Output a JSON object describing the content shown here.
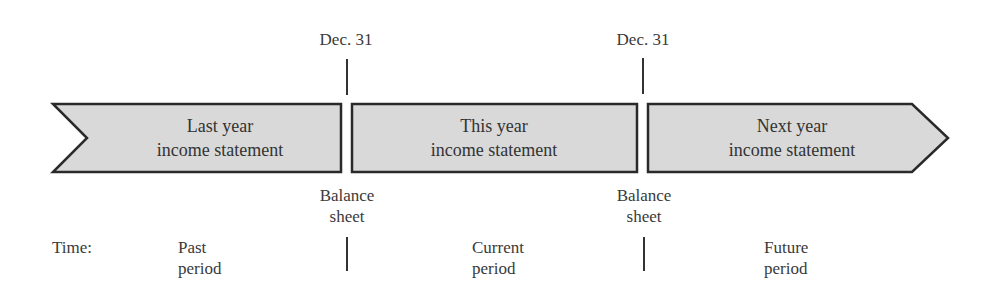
{
  "diagram": {
    "top_labels": [
      {
        "id": "dec31-left",
        "text": "Dec. 31"
      },
      {
        "id": "dec31-right",
        "text": "Dec. 31"
      }
    ],
    "periods": [
      {
        "line1": "Last year",
        "line2": "income statement"
      },
      {
        "line1": "This year",
        "line2": "income statement"
      },
      {
        "line1": "Next year",
        "line2": "income statement"
      }
    ],
    "balance_sheets": [
      {
        "line1": "Balance",
        "line2": "sheet"
      },
      {
        "line1": "Balance",
        "line2": "sheet"
      }
    ],
    "time_label": "Time:",
    "time_periods": [
      {
        "line1": "Past",
        "line2": "period"
      },
      {
        "line1": "Current",
        "line2": "period"
      },
      {
        "line1": "Future",
        "line2": "period"
      }
    ],
    "colors": {
      "fill": "#d9d9d9",
      "stroke": "#2a2a2a",
      "text": "#3a3a3a"
    }
  }
}
